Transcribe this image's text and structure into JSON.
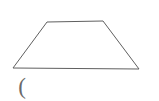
{
  "figure": {
    "shape_name": "trapezoid",
    "background_color": "#ffffff",
    "stroke_color": "#5f5f5f",
    "stroke_width": 1,
    "fill": "none",
    "vertices": [
      {
        "name": "top-left",
        "x": 47,
        "y": 22
      },
      {
        "name": "top-right",
        "x": 103,
        "y": 21
      },
      {
        "name": "bottom-right",
        "x": 139,
        "y": 69
      },
      {
        "name": "bottom-left",
        "x": 13,
        "y": 68
      }
    ],
    "edges": [
      {
        "name": "top-edge",
        "from": "top-left",
        "to": "top-right",
        "length_px": 56
      },
      {
        "name": "right-leg",
        "from": "top-right",
        "to": "bottom-right",
        "length_px": 60
      },
      {
        "name": "bottom-edge",
        "from": "bottom-right",
        "to": "bottom-left",
        "length_px": 126
      },
      {
        "name": "left-leg",
        "from": "bottom-left",
        "to": "top-left",
        "length_px": 57
      }
    ]
  },
  "annotation": {
    "paren_mark": "(",
    "color": "#6a6a6a"
  }
}
